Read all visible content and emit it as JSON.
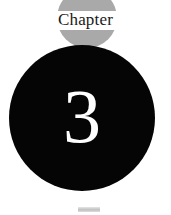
{
  "page": {
    "width": 171,
    "height": 215,
    "background_color": "#ffffff",
    "kind": "book-chapter-opener"
  },
  "chapter_opener": {
    "label": "Chapter",
    "number": "3",
    "label_color": "#1a1a1a",
    "number_color": "#ffffff"
  },
  "decorations": {
    "gray_disc": {
      "name": "gray-circle",
      "color": "#a9a9a9",
      "diameter": 60
    },
    "white_band": {
      "name": "white-knockout-band",
      "color": "#ffffff",
      "height": 19
    },
    "black_disc": {
      "name": "black-circle",
      "color": "#050505",
      "diameter": 146
    },
    "bottom_mark": {
      "name": "clipped-gray-mark",
      "color": "#b4b4b4"
    }
  }
}
